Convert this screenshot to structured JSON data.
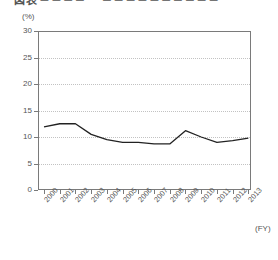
{
  "title": {
    "text": "図表 ─ ─ ─ ─ 　 ─ ─ ─ ─ ─ ─ ─ ─ ─ ─",
    "note": "clipped at top edge of screenshot"
  },
  "unit_label": "(%)",
  "x_axis_caption": "(FY)",
  "chart_data": {
    "type": "line",
    "title": "",
    "xlabel": "(FY)",
    "ylabel": "(%)",
    "ylim": [
      0,
      30
    ],
    "yticks": [
      0,
      5,
      10,
      15,
      20,
      25,
      30
    ],
    "grid": true,
    "legend": "none",
    "categories": [
      "2000",
      "2001",
      "2002",
      "2003",
      "2004",
      "2005",
      "2006",
      "2007",
      "2008",
      "2009",
      "2010",
      "2011",
      "2012",
      "2013"
    ],
    "values": [
      11.9,
      12.5,
      12.5,
      10.5,
      9.5,
      9.0,
      9.0,
      8.7,
      8.7,
      11.2,
      10.0,
      9.0,
      9.3,
      9.8
    ],
    "series": [
      {
        "name": "series-1",
        "color": "#222222",
        "values": [
          11.9,
          12.5,
          12.5,
          10.5,
          9.5,
          9.0,
          9.0,
          8.7,
          8.7,
          11.2,
          10.0,
          9.0,
          9.3,
          9.8
        ]
      }
    ]
  },
  "colors": {
    "line": "#222222",
    "axis": "#7a7a7a",
    "grid": "#c2c2c2",
    "text": "#555555"
  }
}
